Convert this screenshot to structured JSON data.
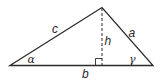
{
  "diagram": {
    "labels": {
      "side_c": "c",
      "side_a": "a",
      "side_b": "b",
      "height": "h",
      "angle_alpha": "α",
      "angle_gamma": "γ"
    },
    "colors": {
      "stroke": "#2a2a2a",
      "background": "#ffffff"
    }
  }
}
